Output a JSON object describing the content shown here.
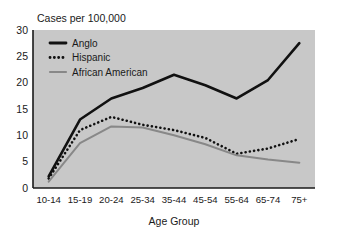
{
  "chart_data": {
    "type": "line",
    "title": "Cases per 100,000",
    "xlabel": "Age Group",
    "ylabel": "",
    "categories": [
      "10-14",
      "15-19",
      "20-24",
      "25-34",
      "35-44",
      "45-54",
      "55-64",
      "65-74",
      "75+"
    ],
    "ylim": [
      0,
      30
    ],
    "yticks": [
      0,
      5,
      10,
      15,
      20,
      25,
      30
    ],
    "ytick_labels": [
      "0",
      "5",
      "10",
      "15",
      "20",
      "25",
      "30"
    ],
    "grid": false,
    "legend_position": "upper-left-inside",
    "plot_background": "#c8c8c8",
    "series": [
      {
        "name": "Anglo",
        "style": "solid-thick",
        "color": "#111111",
        "values": [
          2.2,
          13.0,
          17.0,
          19.0,
          21.5,
          19.5,
          17.0,
          20.5,
          27.5
        ]
      },
      {
        "name": "Hispanic",
        "style": "dotted",
        "color": "#111111",
        "values": [
          1.8,
          11.0,
          13.5,
          12.0,
          11.0,
          9.5,
          6.5,
          7.5,
          9.3
        ]
      },
      {
        "name": "African American",
        "style": "solid",
        "color": "#888888",
        "values": [
          1.2,
          8.5,
          11.7,
          11.5,
          10.0,
          8.3,
          6.2,
          5.4,
          4.8
        ]
      }
    ]
  },
  "legend": {
    "items": [
      {
        "label": "Anglo"
      },
      {
        "label": "Hispanic"
      },
      {
        "label": "African American"
      }
    ]
  }
}
